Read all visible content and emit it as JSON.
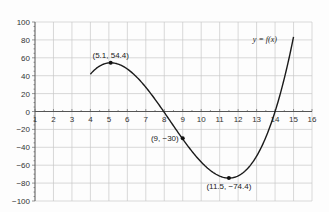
{
  "chart_data": {
    "type": "line",
    "title": "",
    "xlabel": "",
    "ylabel": "",
    "xlim": [
      1,
      16
    ],
    "ylim": [
      -100,
      100
    ],
    "grid": true,
    "legend": null,
    "x_ticks": [
      1,
      2,
      3,
      4,
      5,
      6,
      7,
      8,
      9,
      10,
      11,
      12,
      13,
      14,
      15,
      16
    ],
    "y_ticks": [
      -100,
      -80,
      -60,
      -40,
      -20,
      0,
      20,
      40,
      60,
      80,
      100
    ],
    "y_tick_labels": [
      "−100",
      "−80",
      "−60",
      "−40",
      "−20",
      "0",
      "20",
      "40",
      "60",
      "80",
      "100"
    ],
    "series": [
      {
        "name": "y = f(x)",
        "domain": [
          4,
          15
        ],
        "x": [
          4,
          5,
          5.1,
          6,
          7,
          8,
          9,
          10,
          11,
          11.5,
          12,
          13,
          14,
          15
        ],
        "y": [
          41.7,
          54.3,
          54.4,
          49.9,
          36.7,
          13.9,
          -30.0,
          -55.6,
          -72.9,
          -74.4,
          -72.9,
          -55.6,
          -18.5,
          83.3
        ],
        "color": "#1a1a1a"
      }
    ],
    "marked_points": [
      {
        "x": 5.1,
        "y": 54.4,
        "label": "(5.1, 54.4)",
        "label_pos": "above"
      },
      {
        "x": 9,
        "y": -30,
        "label": "(9, −30)",
        "label_pos": "left"
      },
      {
        "x": 11.5,
        "y": -74.4,
        "label": "(11.5, −74.4)",
        "label_pos": "below"
      }
    ],
    "annotations": [
      {
        "text": "y = f(x)",
        "x": 14.1,
        "y": 78
      }
    ]
  },
  "colors": {
    "grid": "#c8c8c8",
    "axis": "#555555",
    "curve": "#1a1a1a",
    "background": "#fdfdfd"
  }
}
